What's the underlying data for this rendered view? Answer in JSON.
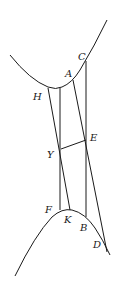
{
  "diagram": {
    "type": "geometric-construction",
    "labels": {
      "C": "C",
      "A": "A",
      "H": "H",
      "E": "E",
      "Y": "Y",
      "F": "F",
      "K": "K",
      "B": "B",
      "D": "D"
    },
    "colors": {
      "stroke": "#1a1a1a",
      "background": "#ffffff"
    }
  }
}
